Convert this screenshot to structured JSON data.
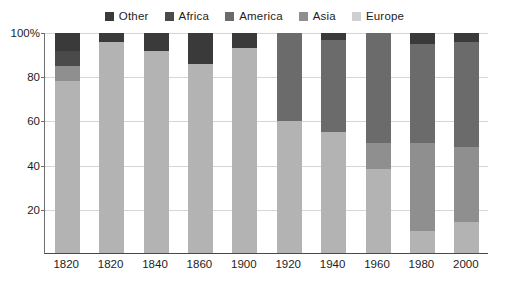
{
  "chart_data": {
    "type": "bar",
    "subtype": "stacked-bar-100-percent",
    "title": "",
    "xlabel": "",
    "ylabel": "",
    "ylim": [
      0,
      100
    ],
    "yticks": [
      20,
      40,
      60,
      80,
      100
    ],
    "ytick_labels": [
      "20",
      "40",
      "60",
      "80",
      "100%"
    ],
    "grid": true,
    "legend_position": "top-center",
    "categories": [
      "1820",
      "1820",
      "1840",
      "1860",
      "1900",
      "1920",
      "1940",
      "1960",
      "1980",
      "2000"
    ],
    "series": [
      {
        "name": "Europe",
        "color": "#b3b3b3",
        "values": [
          78,
          96,
          92,
          86,
          93,
          60,
          55,
          38,
          10,
          14
        ]
      },
      {
        "name": "Asia",
        "color": "#8f8f8f",
        "values": [
          7,
          0,
          0,
          0,
          0,
          0,
          0,
          12,
          40,
          34
        ]
      },
      {
        "name": "America",
        "color": "#6b6b6b",
        "values": [
          0,
          0,
          0,
          0,
          0,
          40,
          42,
          50,
          45,
          48
        ]
      },
      {
        "name": "Africa",
        "color": "#4a4a4a",
        "values": [
          7,
          0,
          0,
          0,
          0,
          0,
          0,
          0,
          0,
          0
        ]
      },
      {
        "name": "Other",
        "color": "#3a3a3a",
        "values": [
          8,
          4,
          8,
          14,
          7,
          0,
          3,
          0,
          5,
          4
        ]
      }
    ],
    "legend": [
      {
        "label": "Other",
        "color": "#3a3a3a"
      },
      {
        "label": "Africa",
        "color": "#4a4a4a"
      },
      {
        "label": "America",
        "color": "#6b6b6b"
      },
      {
        "label": "Asia",
        "color": "#8f8f8f"
      },
      {
        "label": "Europe",
        "color": "#cfcfcf"
      }
    ]
  },
  "colors": {
    "background": "#ffffff",
    "grid": "#d6d6d6",
    "axis": "#4a4a4a",
    "text": "#1d1d1d"
  }
}
